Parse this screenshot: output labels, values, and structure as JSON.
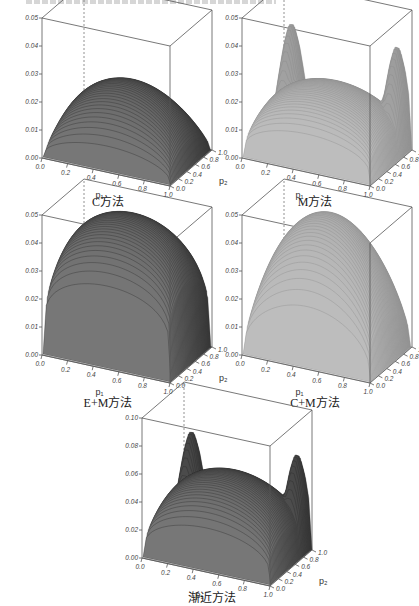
{
  "header": {
    "clipped_text": ""
  },
  "chart_data": [
    {
      "type": "surface3d",
      "title": "C方法",
      "xlabel": "p1",
      "ylabel": "p2",
      "zlabel": "",
      "x_ticks": [
        "0.0",
        "0.2",
        "0.4",
        "0.6",
        "0.8",
        "1.0"
      ],
      "y_ticks": [
        "0.0",
        "0.2",
        "0.4",
        "0.6",
        "0.8",
        "1.0"
      ],
      "z_ticks": [
        "0.00",
        "0.01",
        "0.02",
        "0.03",
        "0.04",
        "0.05"
      ],
      "zlim": [
        0,
        0.05
      ],
      "shape": "plateau",
      "peak_z": 0.026,
      "shade": "dark"
    },
    {
      "type": "surface3d",
      "title": "M方法",
      "xlabel": "p1",
      "ylabel": "p2",
      "zlabel": "",
      "x_ticks": [
        "0.0",
        "0.2",
        "0.4",
        "0.6",
        "0.8",
        "1.0"
      ],
      "y_ticks": [
        "0.0",
        "0.2",
        "0.4",
        "0.6",
        "0.8",
        "1.0"
      ],
      "z_ticks": [
        "0.00",
        "0.01",
        "0.02",
        "0.03",
        "0.04",
        "0.05"
      ],
      "zlim": [
        0,
        0.05
      ],
      "shape": "saddle-corner-peaks",
      "peak_z": 0.046,
      "center_z": 0.025,
      "shade": "light"
    },
    {
      "type": "surface3d",
      "title": "E+M方法",
      "xlabel": "p1",
      "ylabel": "p2",
      "zlabel": "",
      "x_ticks": [
        "0.0",
        "0.2",
        "0.4",
        "0.6",
        "0.8",
        "1.0"
      ],
      "y_ticks": [
        "0.0",
        "0.2",
        "0.4",
        "0.6",
        "0.8",
        "1.0"
      ],
      "z_ticks": [
        "0.00",
        "0.01",
        "0.02",
        "0.03",
        "0.04",
        "0.05"
      ],
      "zlim": [
        0,
        0.05
      ],
      "shape": "high-plateau",
      "peak_z": 0.05,
      "shade": "dark"
    },
    {
      "type": "surface3d",
      "title": "C+M方法",
      "xlabel": "p1",
      "ylabel": "p2",
      "zlabel": "",
      "x_ticks": [
        "0.0",
        "0.2",
        "0.4",
        "0.6",
        "0.8",
        "1.0"
      ],
      "y_ticks": [
        "0.0",
        "0.2",
        "0.4",
        "0.6",
        "0.8",
        "1.0"
      ],
      "z_ticks": [
        "0.00",
        "0.01",
        "0.02",
        "0.03",
        "0.04",
        "0.05"
      ],
      "zlim": [
        0,
        0.05
      ],
      "shape": "dome",
      "peak_z": 0.05,
      "shade": "light"
    },
    {
      "type": "surface3d",
      "title": "渐近方法",
      "xlabel": "p1",
      "ylabel": "p2",
      "zlabel": "",
      "x_ticks": [
        "0.0",
        "0.2",
        "0.4",
        "0.6",
        "0.8",
        "1.0"
      ],
      "y_ticks": [
        "0.0",
        "0.2",
        "0.4",
        "0.6",
        "0.8",
        "1.0"
      ],
      "z_ticks": [
        "0.00",
        "0.02",
        "0.04",
        "0.06",
        "0.08",
        "0.10"
      ],
      "zlim": [
        0,
        0.1
      ],
      "shape": "saddle-corner-peaks",
      "peak_z": 0.085,
      "center_z": 0.058,
      "shade": "dark"
    }
  ],
  "captions": [
    "C方法",
    "M方法",
    "E+M方法",
    "C+M方法",
    "渐近方法"
  ],
  "axis": {
    "p1": "p₁",
    "p2": "p₂"
  },
  "ticks_z1": [
    "0.00",
    "0.01",
    "0.02",
    "0.03",
    "0.04",
    "0.05"
  ],
  "ticks_z2": [
    "0.00",
    "0.02",
    "0.04",
    "0.06",
    "0.08",
    "0.10"
  ],
  "ticks_x": [
    "0.0",
    "0.2",
    "0.4",
    "0.6",
    "0.8",
    "1.0"
  ],
  "ticks_y": [
    "0.0",
    "0.2",
    "0.4",
    "0.6",
    "0.8",
    "1.0"
  ]
}
